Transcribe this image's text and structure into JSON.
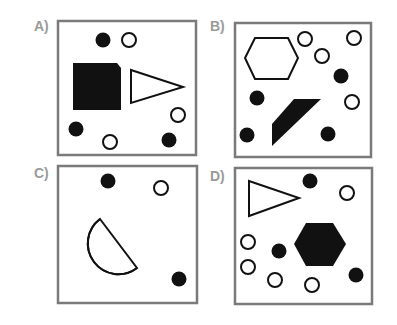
{
  "panels": [
    {
      "label": "A)",
      "shapes": [
        "filled-circle",
        "outline-circle",
        "filled-square-clipped-corner",
        "outline-triangle",
        "outline-circle",
        "filled-circle",
        "outline-circle",
        "filled-circle"
      ]
    },
    {
      "label": "B)",
      "shapes": [
        "outline-hexagon",
        "outline-circle",
        "outline-circle",
        "outline-circle",
        "filled-circle",
        "filled-circle",
        "outline-circle",
        "filled-parallelogram",
        "filled-circle",
        "filled-circle"
      ]
    },
    {
      "label": "C)",
      "shapes": [
        "filled-circle",
        "outline-circle",
        "outline-semicircle",
        "filled-circle"
      ]
    },
    {
      "label": "D)",
      "shapes": [
        "outline-triangle",
        "filled-circle",
        "outline-circle",
        "filled-hexagon",
        "outline-circle",
        "filled-circle",
        "outline-circle",
        "outline-circle",
        "outline-circle",
        "filled-circle"
      ]
    }
  ],
  "colors": {
    "frame": "#7a7a7a",
    "shape": "#111111",
    "label": "#9a9a9a"
  }
}
